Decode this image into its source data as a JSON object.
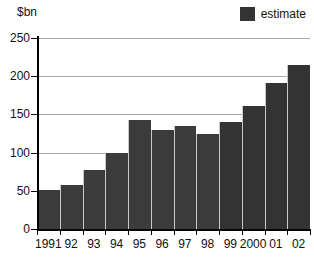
{
  "chart_data": {
    "type": "bar",
    "title": "",
    "subtitle": "",
    "ylabel": "$bn",
    "xlabel": "",
    "ylim": [
      0,
      250
    ],
    "yticks": [
      0,
      50,
      100,
      150,
      200,
      250
    ],
    "grid": true,
    "legend_position": "top-right",
    "categories": [
      "1991",
      "92",
      "93",
      "94",
      "95",
      "96",
      "97",
      "98",
      "99",
      "2000",
      "01",
      "02"
    ],
    "values": [
      51,
      58,
      77,
      100,
      143,
      130,
      135,
      124,
      140,
      161,
      191,
      215
    ],
    "series": [
      {
        "name": "actual",
        "values": [
          51,
          58,
          77,
          100,
          143,
          130,
          135,
          124,
          null,
          null,
          null,
          null
        ]
      },
      {
        "name": "estimate",
        "values": [
          null,
          null,
          null,
          null,
          null,
          null,
          null,
          null,
          140,
          161,
          191,
          215
        ]
      }
    ],
    "estimate_from_index": 8,
    "legend": [
      {
        "label": "estimate",
        "color": "#333333"
      }
    ],
    "colors": {
      "bar_actual": "#3b3b3b",
      "bar_estimate": "#333333",
      "gridline": "#a9a9a9",
      "axis": "#000000",
      "text": "#111111",
      "background": "#ffffff"
    }
  },
  "legend": {
    "estimate_label": "estimate"
  },
  "axis": {
    "y_title": "$bn"
  }
}
